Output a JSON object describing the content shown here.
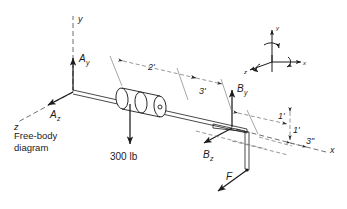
{
  "diagram": {
    "caption": "Free-body diagram",
    "caption_line1": "Free-body",
    "caption_line2": "diagram",
    "colors": {
      "ink": "#1b1b1b",
      "dim": "#6a6a72",
      "axis_dash": "#4a4a52",
      "background": "#ffffff"
    },
    "main_axes": [
      {
        "name": "y-axis-label",
        "text": "y"
      },
      {
        "name": "z-axis-label",
        "text": "z"
      },
      {
        "name": "x-axis-label",
        "text": "x"
      }
    ],
    "reactions": [
      {
        "name": "reaction-ay",
        "symbol": "A",
        "sub": "y"
      },
      {
        "name": "reaction-az",
        "symbol": "A",
        "sub": "z"
      },
      {
        "name": "reaction-by",
        "symbol": "B",
        "sub": "y"
      },
      {
        "name": "reaction-bz",
        "symbol": "B",
        "sub": "z"
      }
    ],
    "loads": [
      {
        "name": "load-300lb",
        "text": "300 lb"
      },
      {
        "name": "force-f",
        "text": "F"
      }
    ],
    "dimensions": [
      {
        "name": "dim-2ft",
        "text": "2'"
      },
      {
        "name": "dim-3ft",
        "text": "3'"
      },
      {
        "name": "dim-1ft-horizontal",
        "text": "1'"
      },
      {
        "name": "dim-1ft-vertical",
        "text": "1'"
      },
      {
        "name": "dim-3in",
        "text": "3\""
      }
    ],
    "triad": {
      "name": "coordinate-triad",
      "x_label": "x",
      "y_label": "y",
      "z_label": "z"
    }
  }
}
